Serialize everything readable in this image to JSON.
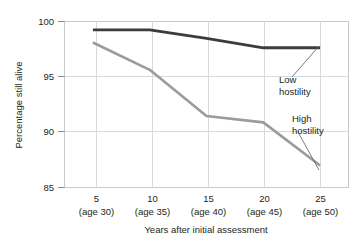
{
  "chart_data": {
    "type": "line",
    "title": "",
    "xlabel": "Years after initial assessment",
    "ylabel": "Percentage still alive",
    "x": [
      5,
      10,
      15,
      20,
      25
    ],
    "categories": [
      "5",
      "10",
      "15",
      "20",
      "25"
    ],
    "category_sublabels": [
      "(age 30)",
      "(age 35)",
      "(age 40)",
      "(age 45)",
      "(age 50)"
    ],
    "xticklabels": [
      "5",
      "10",
      "15",
      "20",
      "25"
    ],
    "yticklabels": [
      "85",
      "90",
      "95",
      "100"
    ],
    "yticks": [
      85,
      90,
      95,
      100
    ],
    "ylim": [
      84.5,
      100.3
    ],
    "xlim": [
      2.5,
      27.5
    ],
    "grid": true,
    "legend": "annotations",
    "series": [
      {
        "name": "Low hostility",
        "color": "#3c3c3c",
        "values": [
          99.5,
          99.5,
          98.7,
          97.8,
          97.8
        ]
      },
      {
        "name": "High hostility",
        "color": "#9b9b9b",
        "values": [
          98.3,
          95.7,
          91.3,
          90.7,
          86.6
        ]
      }
    ],
    "annotations": [
      {
        "text_line1": "Low",
        "text_line2": "hostility"
      },
      {
        "text_line1": "High",
        "text_line2": "hostility"
      }
    ]
  },
  "axis": {
    "y_label": "Percentage still alive",
    "x_label": "Years after initial assessment",
    "y_tick_0": "85",
    "y_tick_1": "90",
    "y_tick_2": "95",
    "y_tick_3": "100",
    "x_tick_0": "5",
    "x_tick_1": "10",
    "x_tick_2": "15",
    "x_tick_3": "20",
    "x_tick_4": "25",
    "x_sub_0": "(age 30)",
    "x_sub_1": "(age 35)",
    "x_sub_2": "(age 40)",
    "x_sub_3": "(age 45)",
    "x_sub_4": "(age 50)"
  },
  "annotations": {
    "low_line1": "Low",
    "low_line2": "hostility",
    "high_line1": "High",
    "high_line2": "hostility"
  },
  "colors": {
    "low_hostility": "#3c3c3c",
    "high_hostility": "#9b9b9b",
    "grid": "#d4d4d4",
    "frame": "#c9c9c9",
    "text": "#231f20",
    "background": "#ffffff"
  }
}
